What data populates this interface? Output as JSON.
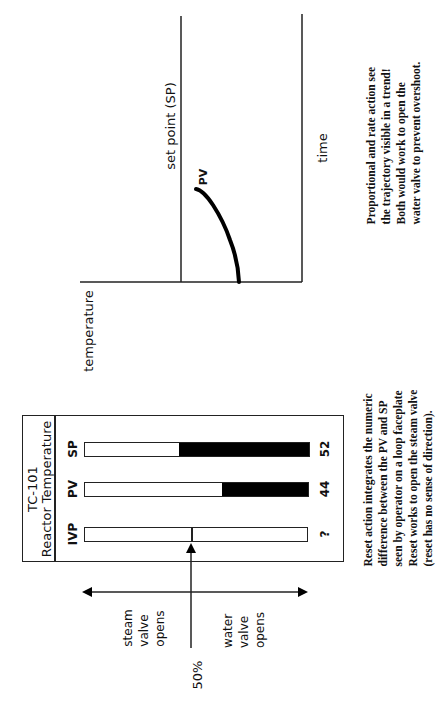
{
  "trend_chart": {
    "y_axis_label": "temperature",
    "x_axis_label": "time",
    "setpoint_label": "set point (SP)",
    "pv_label": "PV",
    "curve_description": "PV rising toward set point, flattening as it approaches"
  },
  "trend_note": {
    "lines": [
      "Proportional and rate action see",
      "the trajectory visible in a trend!",
      "Both would work to open the",
      "water valve to prevent overshoot."
    ]
  },
  "faceplate": {
    "tag": "TC-101",
    "description": "Reactor Temperature",
    "bars": [
      {
        "label": "SP",
        "value": "52",
        "fill_percent": 52
      },
      {
        "label": "PV",
        "value": "44",
        "fill_percent": 38
      },
      {
        "label": "IVP",
        "value": "?",
        "fill_percent": 0,
        "marker_percent": 50
      }
    ]
  },
  "valve_direction": {
    "left_label_lines": [
      "steam",
      "valve",
      "opens"
    ],
    "right_label_lines": [
      "water",
      "valve",
      "opens"
    ],
    "midpoint_label": "50%"
  },
  "reset_note": {
    "lines": [
      "Reset action integrates the numeric",
      "difference between the PV and SP",
      "seen by operator on a loop faceplate",
      "Reset works to open the steam valve",
      "(reset has no sense of direction)."
    ]
  },
  "colors": {
    "ink": "#111111",
    "fill": "#000000",
    "background": "#ffffff"
  }
}
